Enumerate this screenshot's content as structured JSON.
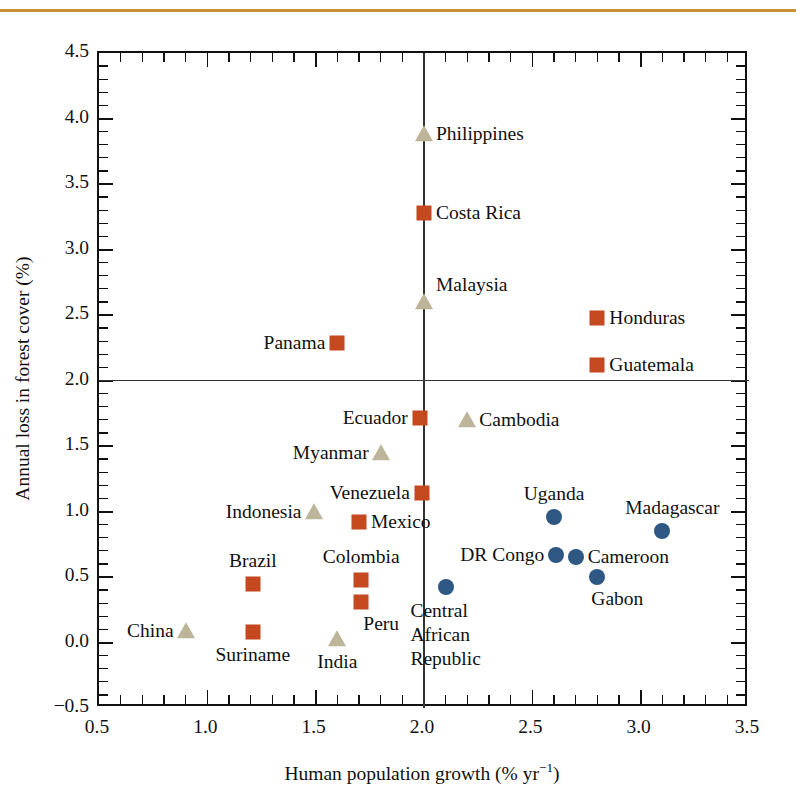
{
  "figure": {
    "accent_rule_color": "#c79234",
    "background": "#ffffff"
  },
  "chart_data": {
    "type": "scatter",
    "title": "",
    "xlabel_text": "Human population growth (% yr",
    "xlabel_sup": "−1",
    "xlabel_tail": ")",
    "xlabel": "Human population growth (% yr−1)",
    "ylabel": "Annual loss in forest cover (%)",
    "xlim": [
      0.5,
      3.5
    ],
    "ylim": [
      -0.5,
      4.5
    ],
    "xticks": [
      0.5,
      1.0,
      1.5,
      2.0,
      2.5,
      3.0,
      3.5
    ],
    "xtick_labels": [
      "0.5",
      "1.0",
      "1.5",
      "2.0",
      "2.5",
      "3.0",
      "3.5"
    ],
    "yticks": [
      -0.5,
      0.0,
      0.5,
      1.0,
      1.5,
      2.0,
      2.5,
      3.0,
      3.5,
      4.0,
      4.5
    ],
    "ytick_labels": [
      "−0.5",
      "0.0",
      "0.5",
      "1.0",
      "1.5",
      "2.0",
      "2.5",
      "3.0",
      "3.5",
      "4.0",
      "4.5"
    ],
    "x_minor_step": 0.1,
    "y_minor_step": 0.1,
    "grid": false,
    "legend": null,
    "reference_lines": [
      {
        "orientation": "vertical",
        "value": 2.0,
        "color": "#333333"
      },
      {
        "orientation": "horizontal",
        "value": 2.0,
        "color": "#333333"
      }
    ],
    "marker_styles": {
      "square": {
        "shape": "square",
        "color": "#c4491f"
      },
      "circle": {
        "shape": "circle",
        "color": "#2e5784"
      },
      "triangle": {
        "shape": "triangle",
        "color": "#bdb59a"
      }
    },
    "points": [
      {
        "name": "Philippines",
        "x": 2.0,
        "y": 3.88,
        "marker": "triangle",
        "label_pos": "right"
      },
      {
        "name": "Costa Rica",
        "x": 2.0,
        "y": 3.28,
        "marker": "square",
        "label_pos": "right"
      },
      {
        "name": "Malaysia",
        "x": 2.0,
        "y": 2.6,
        "marker": "triangle",
        "label_pos": "right-up"
      },
      {
        "name": "Honduras",
        "x": 2.8,
        "y": 2.48,
        "marker": "square",
        "label_pos": "right"
      },
      {
        "name": "Guatemala",
        "x": 2.8,
        "y": 2.12,
        "marker": "square",
        "label_pos": "right"
      },
      {
        "name": "Panama",
        "x": 1.6,
        "y": 2.29,
        "marker": "square",
        "label_pos": "left"
      },
      {
        "name": "Ecuador",
        "x": 1.98,
        "y": 1.71,
        "marker": "square",
        "label_pos": "left"
      },
      {
        "name": "Cambodia",
        "x": 2.2,
        "y": 1.7,
        "marker": "triangle",
        "label_pos": "right"
      },
      {
        "name": "Myanmar",
        "x": 1.8,
        "y": 1.45,
        "marker": "triangle",
        "label_pos": "left"
      },
      {
        "name": "Venezuela",
        "x": 1.99,
        "y": 1.14,
        "marker": "square",
        "label_pos": "left"
      },
      {
        "name": "Indonesia",
        "x": 1.49,
        "y": 1.0,
        "marker": "triangle",
        "label_pos": "left"
      },
      {
        "name": "Mexico",
        "x": 1.7,
        "y": 0.92,
        "marker": "square",
        "label_pos": "right"
      },
      {
        "name": "Uganda",
        "x": 2.6,
        "y": 0.96,
        "marker": "circle",
        "label_pos": "above"
      },
      {
        "name": "Madagascar",
        "x": 3.1,
        "y": 0.85,
        "marker": "circle",
        "label_pos": "above-right"
      },
      {
        "name": "DR Congo",
        "x": 2.61,
        "y": 0.67,
        "marker": "circle",
        "label_pos": "left"
      },
      {
        "name": "Cameroon",
        "x": 2.7,
        "y": 0.65,
        "marker": "circle",
        "label_pos": "right"
      },
      {
        "name": "Gabon",
        "x": 2.8,
        "y": 0.5,
        "marker": "circle",
        "label_pos": "below-right"
      },
      {
        "name": "Colombia",
        "x": 1.71,
        "y": 0.48,
        "marker": "square",
        "label_pos": "above"
      },
      {
        "name": "Brazil",
        "x": 1.21,
        "y": 0.45,
        "marker": "square",
        "label_pos": "above"
      },
      {
        "name": "Peru",
        "x": 1.71,
        "y": 0.31,
        "marker": "square",
        "label_pos": "below-right"
      },
      {
        "name": "Central African Republic",
        "x": 2.1,
        "y": 0.42,
        "marker": "circle",
        "label_pos": "below",
        "label_lines": [
          "Central",
          "African",
          "Republic"
        ]
      },
      {
        "name": "China",
        "x": 0.9,
        "y": 0.09,
        "marker": "triangle",
        "label_pos": "left"
      },
      {
        "name": "Suriname",
        "x": 1.21,
        "y": 0.08,
        "marker": "square",
        "label_pos": "below"
      },
      {
        "name": "India",
        "x": 1.6,
        "y": 0.03,
        "marker": "triangle",
        "label_pos": "below"
      }
    ]
  }
}
